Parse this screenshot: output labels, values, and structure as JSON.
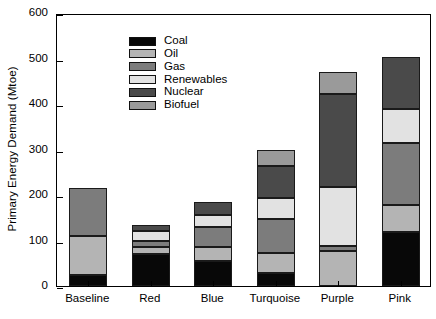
{
  "chart_data": {
    "type": "bar",
    "stacked": true,
    "title": "",
    "xlabel": "",
    "ylabel": "Primary Energy Demand (Mtoe)",
    "ylim": [
      0,
      600
    ],
    "yticks": [
      0,
      100,
      200,
      300,
      400,
      500,
      600
    ],
    "grid": false,
    "legend_position": "upper left inside",
    "categories": [
      "Baseline",
      "Red",
      "Blue",
      "Turquoise",
      "Purple",
      "Pink"
    ],
    "series": [
      {
        "name": "Coal",
        "color": "#080808",
        "values": [
          25,
          70,
          55,
          28,
          0,
          118
        ]
      },
      {
        "name": "Oil",
        "color": "#b4b4b4",
        "values": [
          85,
          15,
          30,
          45,
          78,
          60
        ]
      },
      {
        "name": "Gas",
        "color": "#7c7c7c",
        "values": [
          105,
          15,
          45,
          75,
          10,
          137
        ]
      },
      {
        "name": "Renewables",
        "color": "#e2e2e2",
        "values": [
          0,
          20,
          25,
          45,
          130,
          75
        ]
      },
      {
        "name": "Nuclear",
        "color": "#4a4a4a",
        "values": [
          0,
          15,
          30,
          70,
          205,
          113
        ]
      },
      {
        "name": "Biofuel",
        "color": "#9a9a9a",
        "values": [
          0,
          0,
          0,
          35,
          47,
          0
        ]
      }
    ],
    "totals": [
      215,
      135,
      185,
      298,
      470,
      503
    ]
  },
  "legend": {
    "items": [
      {
        "label": "Coal"
      },
      {
        "label": "Oil"
      },
      {
        "label": "Gas"
      },
      {
        "label": "Renewables"
      },
      {
        "label": "Nuclear"
      },
      {
        "label": "Biofuel"
      }
    ]
  }
}
